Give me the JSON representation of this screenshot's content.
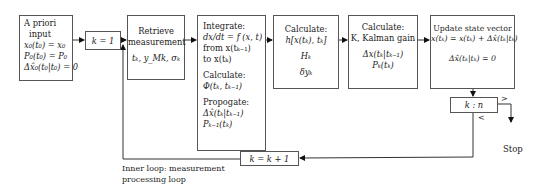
{
  "diagram": {
    "a_priori": {
      "title1": "A priori",
      "title2": "input",
      "eq1": "x₀(t₀) = x₀",
      "eq2": "P₀(t₀) = P₀",
      "eq3": "Δx̂₀(t₀|t₀) = 0"
    },
    "k_init": {
      "label": "k = 1"
    },
    "retrieve": {
      "title1": "Retrieve",
      "title2": "measurement",
      "vars": "tₖ, y_Mk, σₖ"
    },
    "integrate": {
      "l1": "Integrate:",
      "l2": "dx/dt = f (x, t)",
      "l3": "from x(tₖ₋₁)",
      "l4": "to x(tₖ)",
      "l5": "Calculate:",
      "l6": "Φ(tₖ, tₖ₋₁)",
      "l7": "Propogate:",
      "l8": "Δx̂(tₖ|tₖ₋₁)",
      "l9": "Pₖ₋₁(tₖ)"
    },
    "calc_h": {
      "l1": "Calculate:",
      "l2": "h[x(tₖ), tₖ]",
      "l3": "Hₖ",
      "l4": "δyₖ"
    },
    "calc_k": {
      "l1": "Calculate:",
      "l2": "K, Kalman gain",
      "l3": "Δx(tₖ|tₖ₋₁)",
      "l4": "Pₖ(tₖ)"
    },
    "update": {
      "l1": "Update state vector",
      "l2": "x(tₖ) = x(tₖ) + Δx̂(tₖ|tₖ)",
      "l3": "Δx̂(tₖ|tₖ) = 0"
    },
    "compare": {
      "label": "k : n",
      "gt": ">",
      "lt": "<"
    },
    "stop": {
      "label": "Stop"
    },
    "k_incr": {
      "label": "k = k + 1"
    },
    "loop_caption": {
      "l1": "Inner loop: measurement",
      "l2": "processing loop"
    }
  }
}
